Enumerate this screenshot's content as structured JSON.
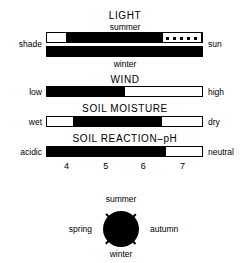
{
  "figure": {
    "type": "ecological-indicator-bars",
    "sections": [
      {
        "id": "light",
        "title": "LIGHT",
        "top_sublabel": "summer",
        "bottom_sublabel": "winter",
        "left_label": "shade",
        "right_label": "sun",
        "bars": [
          {
            "id": "light-summer",
            "segments": [
              {
                "fill": "white",
                "start_pct": 0,
                "end_pct": 12
              },
              {
                "fill": "black",
                "start_pct": 12,
                "end_pct": 74
              },
              {
                "fill": "dotted",
                "start_pct": 74,
                "end_pct": 100
              }
            ]
          },
          {
            "id": "light-winter",
            "segments": [
              {
                "fill": "black",
                "start_pct": 0,
                "end_pct": 100
              }
            ]
          }
        ]
      },
      {
        "id": "wind",
        "title": "WIND",
        "left_label": "low",
        "right_label": "high",
        "bars": [
          {
            "id": "wind-bar",
            "segments": [
              {
                "fill": "black",
                "start_pct": 0,
                "end_pct": 50
              },
              {
                "fill": "white",
                "start_pct": 50,
                "end_pct": 100
              }
            ]
          }
        ]
      },
      {
        "id": "soil-moisture",
        "title": "SOIL MOISTURE",
        "left_label": "wet",
        "right_label": "dry",
        "bars": [
          {
            "id": "soil-moisture-bar",
            "segments": [
              {
                "fill": "white",
                "start_pct": 0,
                "end_pct": 17
              },
              {
                "fill": "black",
                "start_pct": 17,
                "end_pct": 74
              },
              {
                "fill": "white",
                "start_pct": 74,
                "end_pct": 100
              }
            ]
          }
        ]
      },
      {
        "id": "soil-reaction",
        "title": "SOIL REACTION–pH",
        "left_label": "acidic",
        "right_label": "neutral",
        "bars": [
          {
            "id": "soil-reaction-bar",
            "segments": [
              {
                "fill": "black",
                "start_pct": 0,
                "end_pct": 77
              },
              {
                "fill": "white",
                "start_pct": 77,
                "end_pct": 100
              }
            ]
          }
        ],
        "axis": {
          "ticks": [
            {
              "label": "4",
              "pos_pct": 13
            },
            {
              "label": "5",
              "pos_pct": 38
            },
            {
              "label": "6",
              "pos_pct": 62
            },
            {
              "label": "7",
              "pos_pct": 87
            }
          ]
        }
      }
    ],
    "season_circle": {
      "id": "flowering-season",
      "fill": "#000000",
      "top_label": "summer",
      "bottom_label": "winter",
      "left_label": "spring",
      "right_label": "autumn",
      "tick_count": 4
    }
  }
}
